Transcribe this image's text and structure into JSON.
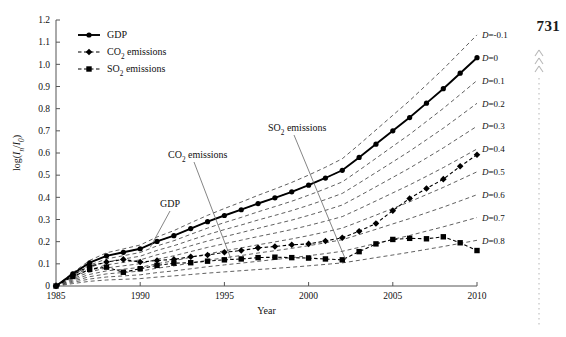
{
  "page": {
    "number": "731"
  },
  "chart_data": {
    "type": "line",
    "title": "",
    "xlabel": "Year",
    "ylabel": "log(In/I0)",
    "ylabel_parts": {
      "prefix": "log(",
      "i1": "I",
      "sub1": "n",
      "slash": "/",
      "i2": "I",
      "sub2": "0",
      "suffix": ")"
    },
    "xlim": [
      1985,
      2010
    ],
    "ylim": [
      0,
      1.2
    ],
    "xticks": [
      "1985",
      "1990",
      "1995",
      "2000",
      "2005",
      "2010"
    ],
    "xtick_values": [
      1985,
      1990,
      1995,
      2000,
      2005,
      2010
    ],
    "yticks": [
      "0",
      "0.1",
      "0.2",
      "0.3",
      "0.4",
      "0.5",
      "0.6",
      "0.7",
      "0.8",
      "0.9",
      "1.0",
      "1.1",
      "1.2"
    ],
    "ytick_values": [
      0,
      0.1,
      0.2,
      0.3,
      0.4,
      0.5,
      0.6,
      0.7,
      0.8,
      0.9,
      1.0,
      1.1,
      1.2
    ],
    "grid": false,
    "legend_position": "top-left",
    "x": [
      1985,
      1986,
      1987,
      1988,
      1989,
      1990,
      1991,
      1992,
      1993,
      1994,
      1995,
      1996,
      1997,
      1998,
      1999,
      2000,
      2001,
      2002,
      2003,
      2004,
      2005,
      2006,
      2007,
      2008,
      2009,
      2010
    ],
    "series": [
      {
        "name": "GDP",
        "label": "GDP",
        "marker": "circle",
        "line_style": "solid",
        "color": "#000000",
        "values": [
          0.0,
          0.055,
          0.105,
          0.136,
          0.152,
          0.168,
          0.201,
          0.227,
          0.259,
          0.29,
          0.318,
          0.344,
          0.372,
          0.398,
          0.425,
          0.455,
          0.487,
          0.522,
          0.58,
          0.64,
          0.7,
          0.76,
          0.825,
          0.89,
          0.96,
          1.03
        ]
      },
      {
        "name": "CO2 emissions",
        "label": "CO₂ emissions",
        "label_parts": {
          "main": "CO",
          "sub": "2",
          "rest": " emissions"
        },
        "marker": "diamond",
        "line_style": "dashed",
        "color": "#000000",
        "values": [
          0.0,
          0.05,
          0.09,
          0.108,
          0.12,
          0.108,
          0.115,
          0.12,
          0.132,
          0.14,
          0.152,
          0.16,
          0.172,
          0.178,
          0.186,
          0.19,
          0.203,
          0.218,
          0.247,
          0.282,
          0.34,
          0.395,
          0.44,
          0.482,
          0.54,
          0.592
        ]
      },
      {
        "name": "SO2 emissions",
        "label": "SO₂ emissions",
        "label_parts": {
          "main": "SO",
          "sub": "2",
          "rest": " emissions"
        },
        "marker": "square",
        "line_style": "dashed",
        "color": "#000000",
        "values": [
          0.0,
          0.043,
          0.075,
          0.085,
          0.062,
          0.078,
          0.093,
          0.103,
          0.105,
          0.112,
          0.118,
          0.122,
          0.128,
          0.13,
          0.128,
          0.126,
          0.122,
          0.118,
          0.155,
          0.19,
          0.21,
          0.215,
          0.213,
          0.222,
          0.195,
          0.16
        ]
      }
    ],
    "reference_lines": {
      "description": "Iso-decoupling reference curves labelled by D value",
      "label_prefix": "D=",
      "values": [
        -0.1,
        0,
        0.1,
        0.2,
        0.3,
        0.4,
        0.5,
        0.6,
        0.7,
        0.8
      ],
      "labels": [
        "D=-0.1",
        "D=0",
        "D=0.1",
        "D=0.2",
        "D=0.3",
        "D=0.4",
        "D=0.5",
        "D=0.6",
        "D=0.7",
        "D=0.8"
      ],
      "end_y": [
        1.143,
        1.03,
        0.927,
        0.824,
        0.721,
        0.618,
        0.515,
        0.412,
        0.309,
        0.206
      ]
    },
    "annotations": [
      {
        "text": "GDP",
        "label_x": 160,
        "label_y": 207,
        "point_year": 1990.6,
        "point_value": 0.175
      },
      {
        "text": "CO₂ emissions",
        "parts": {
          "main": "CO",
          "sub": "2",
          "rest": " emissions"
        },
        "label_x": 168,
        "label_y": 158,
        "point_year": 1995.4,
        "point_value": 0.12
      },
      {
        "text": "SO₂ emissions",
        "parts": {
          "main": "SO",
          "sub": "2",
          "rest": " emissions"
        },
        "label_x": 268,
        "label_y": 131,
        "point_year": 2002.2,
        "point_value": 0.118
      }
    ]
  }
}
